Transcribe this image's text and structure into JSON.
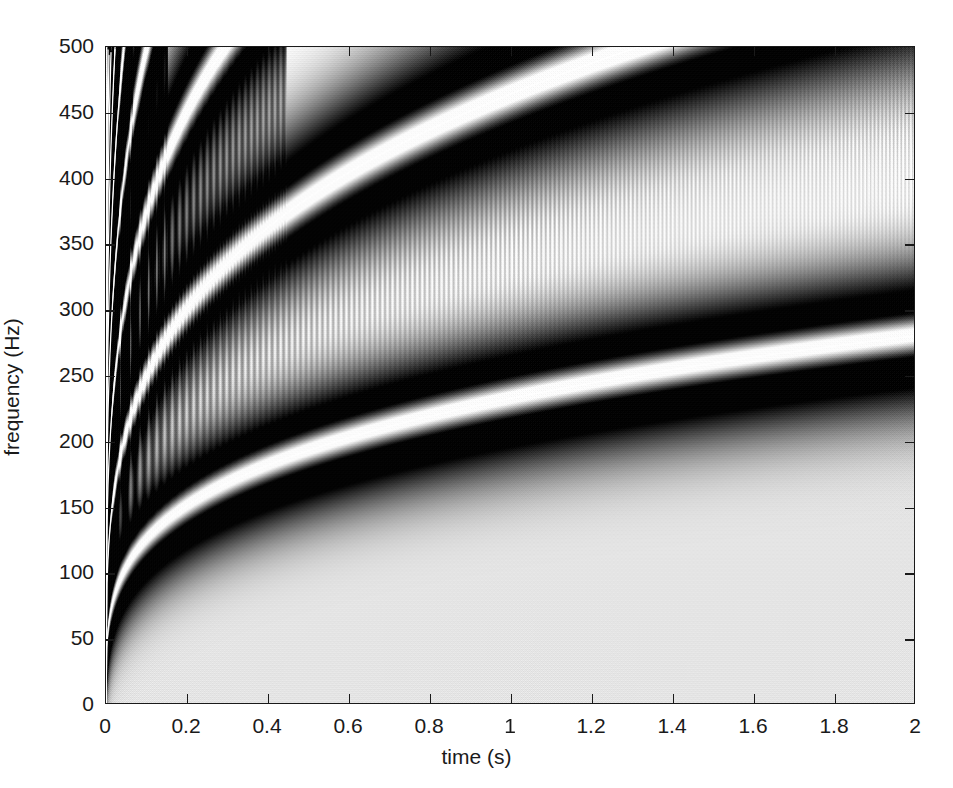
{
  "figure": {
    "type": "time-frequency-distribution",
    "background": "#ffffff",
    "axis_color": "#1a1a1a"
  },
  "axes": {
    "x_title": "time (s)",
    "y_title": "frequency (Hz)",
    "x_ticks": [
      "0",
      "0.2",
      "0.4",
      "0.6",
      "0.8",
      "1",
      "1.2",
      "1.4",
      "1.6",
      "1.8",
      "2"
    ],
    "x_tick_values": [
      0,
      0.2,
      0.4,
      0.6,
      0.8,
      1.0,
      1.2,
      1.4,
      1.6,
      1.8,
      2.0
    ],
    "y_ticks": [
      "0",
      "50",
      "100",
      "150",
      "200",
      "250",
      "300",
      "350",
      "400",
      "450",
      "500"
    ],
    "y_tick_values": [
      0,
      50,
      100,
      150,
      200,
      250,
      300,
      350,
      400,
      450,
      500
    ],
    "xlim": [
      0,
      2
    ],
    "ylim": [
      0,
      500
    ],
    "grid": false
  },
  "chart_data": {
    "type": "heatmap",
    "title": "",
    "xlabel": "time (s)",
    "ylabel": "frequency (Hz)",
    "xlim": [
      0,
      2
    ],
    "ylim": [
      0,
      500
    ],
    "grid": false,
    "legend": "none",
    "colormap": "grayscale-inverted",
    "component_law": "f_k(t) = k * A * t^alpha",
    "A": 232,
    "alpha": 0.27,
    "n_components": 16,
    "component_end_frequencies_at_t2": [
      462,
      352,
      289,
      245,
      212,
      186,
      163,
      145,
      128,
      113,
      99,
      86,
      74,
      62,
      51,
      40
    ],
    "ridge_samples": {
      "t": [
        0.0,
        0.05,
        0.1,
        0.2,
        0.4,
        0.6,
        0.8,
        1.0,
        1.2,
        1.4,
        1.6,
        1.8,
        2.0
      ],
      "component_1_f": [
        0,
        170,
        205,
        247,
        298,
        331,
        358,
        379,
        397,
        413,
        427,
        440,
        462
      ]
    },
    "colors": {
      "ridge": "#ffffff",
      "lobe_dark": "#101010",
      "mid_gray": "#8a8a8a",
      "background": "#ffffff"
    }
  }
}
